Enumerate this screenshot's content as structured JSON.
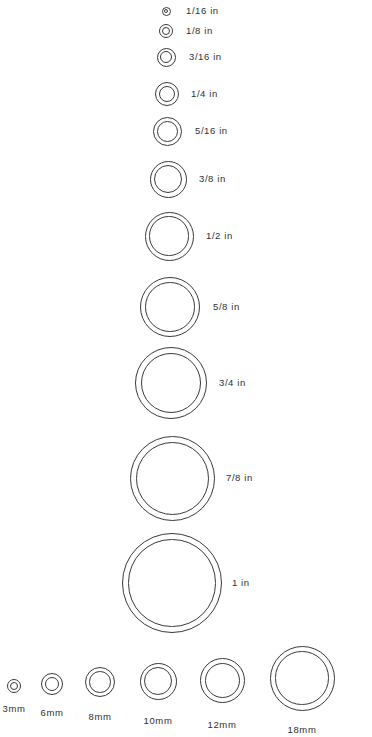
{
  "chart_data": {
    "type": "table",
    "xlabel": "",
    "ylabel": "",
    "legend": [],
    "categories": [
      "1/16 in",
      "1/8 in",
      "3/16 in",
      "1/4 in",
      "5/16 in",
      "3/8 in",
      "1/2 in",
      "5/8 in",
      "3/4 in",
      "7/8 in",
      "1 in",
      "3mm",
      "6mm",
      "8mm",
      "10mm",
      "12mm",
      "18mm"
    ],
    "values": [
      9,
      14,
      19,
      24,
      29,
      37,
      49,
      60,
      72,
      85,
      100,
      14,
      22,
      30,
      37,
      45,
      65
    ]
  },
  "page": {
    "background_color": "#ffffff",
    "stroke_color": "#3a3a3a",
    "text_color": "#2f2f2f"
  },
  "imperial_column": {
    "unit_suffix": "in",
    "items": [
      {
        "label": "1/16 in",
        "cx": 166,
        "cy": 11,
        "outer": 9,
        "gap": 2.4,
        "label_x": 186,
        "label_y": 11
      },
      {
        "label": "1/8 in",
        "cx": 166,
        "cy": 31,
        "outer": 14,
        "gap": 3.0,
        "label_x": 186,
        "label_y": 31
      },
      {
        "label": "3/16 in",
        "cx": 166,
        "cy": 57,
        "outer": 19,
        "gap": 3.4,
        "label_x": 189,
        "label_y": 57
      },
      {
        "label": "1/4 in",
        "cx": 167,
        "cy": 94,
        "outer": 24,
        "gap": 3.8,
        "label_x": 191,
        "label_y": 94
      },
      {
        "label": "5/16 in",
        "cx": 167,
        "cy": 131,
        "outer": 29,
        "gap": 4.0,
        "label_x": 195,
        "label_y": 131
      },
      {
        "label": "3/8 in",
        "cx": 168,
        "cy": 179,
        "outer": 37,
        "gap": 4.4,
        "label_x": 199,
        "label_y": 179
      },
      {
        "label": "1/2 in",
        "cx": 169,
        "cy": 236,
        "outer": 49,
        "gap": 4.8,
        "label_x": 206,
        "label_y": 236
      },
      {
        "label": "5/8 in",
        "cx": 170,
        "cy": 307,
        "outer": 60,
        "gap": 5.2,
        "label_x": 213,
        "label_y": 307
      },
      {
        "label": "3/4 in",
        "cx": 171,
        "cy": 383,
        "outer": 72,
        "gap": 5.6,
        "label_x": 219,
        "label_y": 383
      },
      {
        "label": "7/8 in",
        "cx": 172,
        "cy": 478,
        "outer": 85,
        "gap": 6.0,
        "label_x": 226,
        "label_y": 478
      },
      {
        "label": "1 in",
        "cx": 172,
        "cy": 583,
        "outer": 100,
        "gap": 6.4,
        "label_x": 232,
        "label_y": 583
      }
    ]
  },
  "metric_row": {
    "unit_suffix": "mm",
    "items": [
      {
        "label": "3mm",
        "cx": 14,
        "cy": 686,
        "outer": 14,
        "gap": 3.0,
        "label_x": 14,
        "label_y": 709
      },
      {
        "label": "6mm",
        "cx": 52,
        "cy": 684,
        "outer": 22,
        "gap": 3.8,
        "label_x": 52,
        "label_y": 713
      },
      {
        "label": "8mm",
        "cx": 100,
        "cy": 682,
        "outer": 30,
        "gap": 4.2,
        "label_x": 100,
        "label_y": 717
      },
      {
        "label": "10mm",
        "cx": 158,
        "cy": 681,
        "outer": 37,
        "gap": 4.6,
        "label_x": 158,
        "label_y": 721
      },
      {
        "label": "12mm",
        "cx": 222,
        "cy": 680,
        "outer": 45,
        "gap": 5.0,
        "label_x": 222,
        "label_y": 725
      },
      {
        "label": "18mm",
        "cx": 302,
        "cy": 678,
        "outer": 65,
        "gap": 5.8,
        "label_x": 302,
        "label_y": 730
      }
    ]
  }
}
